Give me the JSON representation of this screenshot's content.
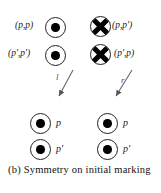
{
  "figure": {
    "caption": "(b) Symmetry on initial marking",
    "background_color": "#ffffff",
    "ink_color": "#1a1a1a"
  },
  "top_row": {
    "left": [
      {
        "label": "(p,p)",
        "marked": true,
        "crossed": false
      },
      {
        "label": "(p',p')",
        "marked": true,
        "crossed": false
      }
    ],
    "right": [
      {
        "label": "(p,p')",
        "marked": false,
        "crossed": true
      },
      {
        "label": "(p',p)",
        "marked": false,
        "crossed": true
      }
    ]
  },
  "arrows": [
    {
      "label": "l",
      "direction": "down-left"
    },
    {
      "label": "r",
      "direction": "down-left"
    }
  ],
  "bottom_row": {
    "left": [
      {
        "label": "p",
        "marked": true
      },
      {
        "label": "p'",
        "marked": true
      }
    ],
    "right": [
      {
        "label": "p",
        "marked": true
      },
      {
        "label": "p'",
        "marked": true
      }
    ]
  }
}
